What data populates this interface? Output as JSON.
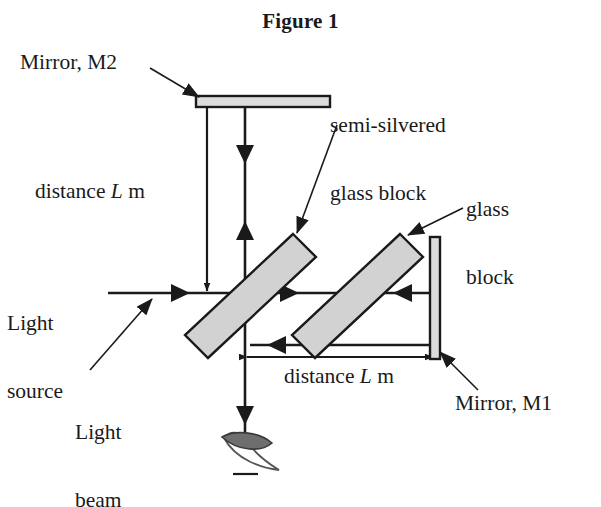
{
  "figure": {
    "title": "Figure 1",
    "kind": "michelson-interferometer-diagram"
  },
  "labels": {
    "mirror_m2": "Mirror, M2",
    "semi_silvered_line1": "semi-silvered",
    "semi_silvered_line2": "glass block",
    "glass_block_line1": "glass",
    "glass_block_line2": "block",
    "distance_vertical_pre": "distance ",
    "distance_vertical_var": "L",
    "distance_vertical_post": " m",
    "light_source_line1": "Light",
    "light_source_line2": "source",
    "light_beam_line1": "Light",
    "light_beam_line2": "beam",
    "distance_horizontal_pre": "distance ",
    "distance_horizontal_var": "L",
    "distance_horizontal_post": " m",
    "mirror_m1": "Mirror, M1"
  },
  "colors": {
    "stroke": "#1a1a1a",
    "glass_fill": "#d2d2d2",
    "mirror_fill": "#dcdcdc",
    "eye_pupil": "#6e6e6e",
    "background": "#ffffff"
  },
  "geometry": {
    "beam_axis_y": 293,
    "splitter_center_x": 245,
    "glass_block_2_center_x": 352,
    "mirror_m2_y": 102,
    "mirror_m1_x": 435,
    "eye_y": 455
  }
}
